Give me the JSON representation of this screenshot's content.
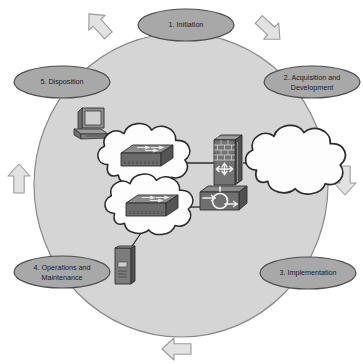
{
  "diagram": {
    "type": "cyclic-process-diagram",
    "direction": "clockwise",
    "colors": {
      "background": "#ffffff",
      "cycle_fill": "#d5d5d5",
      "cycle_stroke": "#8c8c8c",
      "phase_fill": "#a8a8a8",
      "phase_stroke": "#4d4d4d",
      "phase_text": "#1a1a1a",
      "arrow_fill": "#e2e2e2",
      "arrow_stroke": "#9a9a9a",
      "device_dark": "#5a5a5a",
      "device_mid": "#7e7e7e",
      "device_light": "#9d9d9d",
      "cloud_fill": "#fdfdfd",
      "cloud_stroke": "#2b2b2b",
      "link_stroke": "#2b2b2b"
    },
    "phases": [
      {
        "id": "initiation",
        "label": "1. Initiation",
        "lines": [
          "1. Initiation"
        ],
        "cx": 186,
        "cy": 25,
        "rx": 48,
        "ry": 16
      },
      {
        "id": "acquisition",
        "label": "2. Acquisition and Development",
        "lines": [
          "2. Acquisition and",
          "Development"
        ],
        "cx": 312,
        "cy": 82,
        "rx": 48,
        "ry": 16
      },
      {
        "id": "implementation",
        "label": "3. Implementation",
        "lines": [
          "3. Implementation"
        ],
        "cx": 308,
        "cy": 273,
        "rx": 48,
        "ry": 16
      },
      {
        "id": "operations",
        "label": "4. Operations and Maintenance",
        "lines": [
          "4. Operations and",
          "Maintenance"
        ],
        "cx": 62,
        "cy": 272,
        "rx": 48,
        "ry": 16
      },
      {
        "id": "disposition",
        "label": "5. Disposition",
        "lines": [
          "5. Disposition"
        ],
        "cx": 62,
        "cy": 82,
        "rx": 48,
        "ry": 16
      }
    ],
    "flow_arrows": [
      {
        "id": "arrow-top-left",
        "direction": "up-right",
        "rotation": -42,
        "cx": 99,
        "cy": 25
      },
      {
        "id": "arrow-top-right",
        "direction": "down-right",
        "rotation": 133,
        "cx": 269,
        "cy": 29
      },
      {
        "id": "arrow-right",
        "direction": "down",
        "rotation": 180,
        "cx": 345,
        "cy": 180
      },
      {
        "id": "arrow-bottom",
        "direction": "left",
        "rotation": -90,
        "cx": 177,
        "cy": 349
      },
      {
        "id": "arrow-left",
        "direction": "up",
        "rotation": 0,
        "cx": 19,
        "cy": 179
      }
    ],
    "network": {
      "nodes": [
        {
          "id": "workstation",
          "type": "workstation-icon",
          "label": "workstation",
          "x": 92,
          "y": 125
        },
        {
          "id": "cloud-upper",
          "type": "cloud-icon",
          "label": "network cloud",
          "x": 147,
          "y": 158
        },
        {
          "id": "switch-upper",
          "type": "switch-icon",
          "label": "switch",
          "x": 147,
          "y": 156
        },
        {
          "id": "cloud-lower",
          "type": "cloud-icon",
          "label": "network cloud",
          "x": 152,
          "y": 210
        },
        {
          "id": "switch-lower",
          "type": "switch-icon",
          "label": "switch",
          "x": 152,
          "y": 208
        },
        {
          "id": "firewall",
          "type": "firewall-icon",
          "label": "firewall",
          "x": 228,
          "y": 168
        },
        {
          "id": "router",
          "type": "router-icon",
          "label": "router",
          "x": 225,
          "y": 205
        },
        {
          "id": "cloud-internet",
          "type": "cloud-icon",
          "label": "internet cloud",
          "x": 297,
          "y": 165
        },
        {
          "id": "server",
          "type": "server-icon",
          "label": "server",
          "x": 125,
          "y": 265
        }
      ],
      "links": [
        {
          "from": "workstation",
          "to": "cloud-upper"
        },
        {
          "from": "cloud-upper",
          "to": "firewall"
        },
        {
          "from": "firewall",
          "to": "cloud-internet"
        },
        {
          "from": "cloud-lower",
          "to": "router"
        },
        {
          "from": "server",
          "to": "cloud-lower"
        }
      ]
    }
  }
}
